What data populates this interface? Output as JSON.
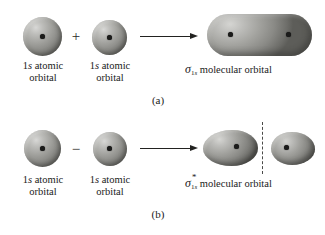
{
  "figure": {
    "title_visible": false,
    "background_color": "#ffffff",
    "orbital_color": "#8a8a86",
    "nucleus_color": "#1b1b1a",
    "line_color": "#222220"
  },
  "panels": [
    {
      "id": "a",
      "label": "(a)",
      "operator": "+",
      "operator_name": "plus-sign",
      "arrow": "→",
      "reactants": [
        {
          "line1_prefix": "1",
          "line1_italic": "s",
          "line1_suffix": " atomic",
          "line2": "orbital"
        },
        {
          "line1_prefix": "1",
          "line1_italic": "s",
          "line1_suffix": " atomic",
          "line2": "orbital"
        }
      ],
      "product": {
        "symbol": "σ",
        "subscript_number": "1",
        "subscript_italic": "s",
        "antibonding": false,
        "star": "",
        "text": " molecular orbital"
      },
      "product_shape": "capsule",
      "nuclei_count": 2,
      "node_line": false
    },
    {
      "id": "b",
      "label": "(b)",
      "operator": "−",
      "operator_name": "minus-sign",
      "arrow": "→",
      "reactants": [
        {
          "line1_prefix": "1",
          "line1_italic": "s",
          "line1_suffix": " atomic",
          "line2": "orbital"
        },
        {
          "line1_prefix": "1",
          "line1_italic": "s",
          "line1_suffix": " atomic",
          "line2": "orbital"
        }
      ],
      "product": {
        "symbol": "σ",
        "subscript_number": "1",
        "subscript_italic": "s",
        "antibonding": true,
        "star": "*",
        "text": " molecular orbital"
      },
      "product_shape": "two-lobes",
      "nuclei_count": 2,
      "node_line": true
    }
  ]
}
